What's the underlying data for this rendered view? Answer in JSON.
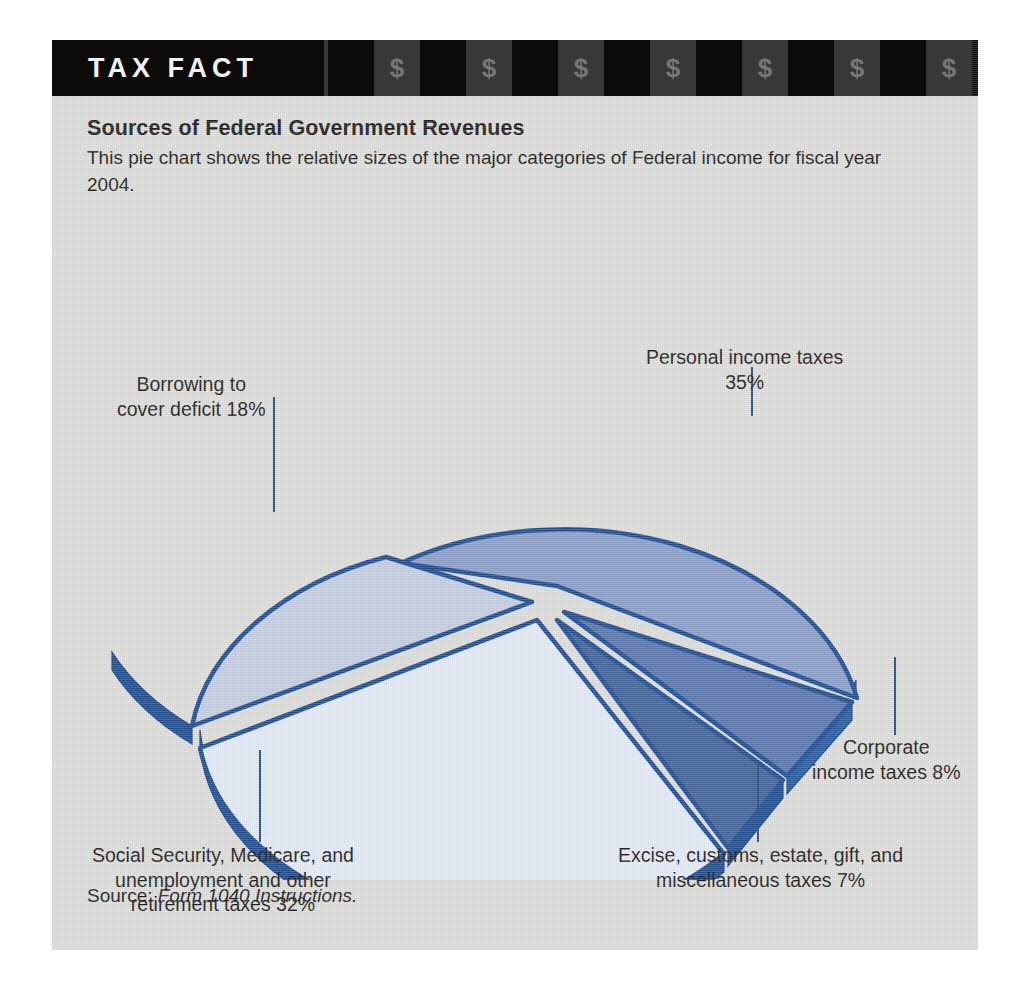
{
  "header": {
    "title": "TAX FACT",
    "currency_glyph": "$",
    "block_pattern": [
      "dark",
      "grey",
      "dark",
      "grey",
      "dark",
      "grey",
      "dark",
      "grey",
      "dark",
      "grey",
      "dark",
      "grey",
      "dark",
      "grey",
      "dark",
      "grey",
      "dark",
      "grey",
      "dark",
      "grey"
    ]
  },
  "intro": {
    "title": "Sources of Federal Government Revenues",
    "body": "This pie chart shows the relative sizes of the major categories of Federal income for fiscal year 2004."
  },
  "source": {
    "prefix": "Source: ",
    "reference": "Form 1040 Instructions."
  },
  "labels": {
    "personal": {
      "line1": "Personal income taxes",
      "line2": "35%"
    },
    "borrowing": {
      "line1": "Borrowing to",
      "line2": "cover deficit 18%"
    },
    "corporate": {
      "line1": "Corporate",
      "line2": "income taxes 8%"
    },
    "excise": {
      "line1": "Excise, customs, estate, gift, and",
      "line2": "miscellaneous taxes 7%"
    },
    "social": {
      "line1": "Social Security, Medicare, and",
      "line2": "unemployment and other",
      "line3": "retirement taxes 32%"
    }
  },
  "colors": {
    "card_background": "#dcdcda",
    "header_black": "#0d0a0a",
    "header_grey": "#3a3737",
    "text": "#231f20",
    "slice_outline": "#23508f",
    "personal": "#8d9fc6",
    "corporate": "#5d77ab",
    "excise": "#456698",
    "social": "#e2e9f3",
    "borrowing": "#c3cddf",
    "leader_line": "#2b4c7e"
  },
  "chart_data": {
    "type": "pie",
    "title": "Sources of Federal Government Revenues",
    "subtitle": "This pie chart shows the relative sizes of the major categories of Federal income for fiscal year 2004.",
    "source": "Form 1040 Instructions.",
    "unit": "%",
    "legend_position": "callout-labels",
    "exploded": true,
    "three_d": true,
    "categories": [
      "Personal income taxes",
      "Corporate income taxes",
      "Excise, customs, estate, gift, and miscellaneous taxes",
      "Social Security, Medicare, and unemployment and other retirement taxes",
      "Borrowing to cover deficit"
    ],
    "values": [
      35,
      8,
      7,
      32,
      18
    ],
    "slice_colors": [
      "#8d9fc6",
      "#5d77ab",
      "#456698",
      "#e2e9f3",
      "#c3cddf"
    ],
    "total": 100
  }
}
